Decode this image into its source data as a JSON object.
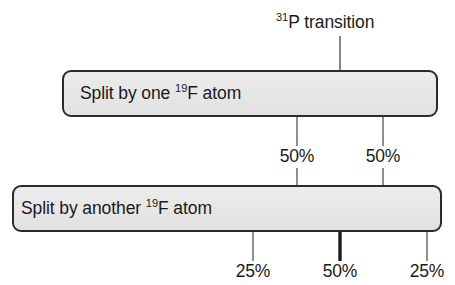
{
  "diagram": {
    "title": {
      "superscript": "31",
      "text": "P transition"
    },
    "stage_one": {
      "box_label_prefix": "Split by one ",
      "box_label_superscript": "19",
      "box_label_suffix": "F atom",
      "branch_labels": [
        "50%",
        "50%"
      ]
    },
    "stage_two": {
      "box_label_prefix": "Split by another ",
      "box_label_superscript": "19",
      "box_label_suffix": "F atom",
      "branch_labels": [
        "25%",
        "50%",
        "25%"
      ]
    },
    "colors": {
      "box_fill": "#e8e8e8",
      "box_border": "#2b2b2b",
      "line": "#4a4a4a",
      "emphasis_line": "#1a1a1a",
      "text": "#1a1a1a",
      "background": "#ffffff"
    },
    "geometry": {
      "root_x": 340,
      "stage_one_legs_x": [
        297,
        383
      ],
      "stage_two_legs_x": [
        253,
        340,
        427
      ],
      "emphasized_leg_x": 340
    }
  }
}
